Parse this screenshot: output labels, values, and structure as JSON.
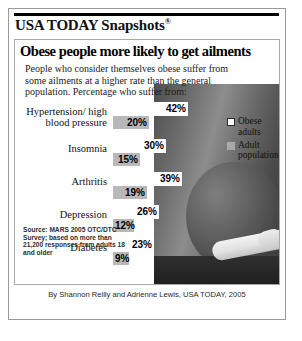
{
  "masthead": {
    "brand": "USA TODAY Snapshots",
    "registered_mark": "®"
  },
  "headline": "Obese people more likely to get ailments",
  "deck": "People who consider themselves obese suffer from some ailments at a higher rate than the general population. Percentage who suffer from:",
  "legend": {
    "items": [
      {
        "label": "Obese adults",
        "swatch": "white-outline",
        "color": "#ffffff"
      },
      {
        "label": "Adult population",
        "swatch": "gray-filled",
        "color": "#a9a9a9"
      }
    ]
  },
  "source": "Source: MARS 2005 OTC/DTC Survey; based on more than 21,200 responses from adults 18 and older",
  "credit": "By Shannon Reilly and Adrienne Lewis, USA TODAY, 2005",
  "chart_data": {
    "type": "bar",
    "orientation": "horizontal",
    "title": "Obese people more likely to get ailments",
    "subtitle": "People who consider themselves obese suffer from some ailments at a higher rate than the general population. Percentage who suffer from:",
    "categories": [
      "Hypertension/ high blood pressure",
      "Insomnia",
      "Arthritis",
      "Depression",
      "Diabetes"
    ],
    "series": [
      {
        "name": "Obese adults",
        "color": "#ffffff",
        "values": [
          42,
          30,
          39,
          26,
          23
        ]
      },
      {
        "name": "Adult population",
        "color": "#b8b8b8",
        "values": [
          20,
          15,
          19,
          12,
          9
        ]
      }
    ],
    "value_labels": [
      [
        "42%",
        "20%"
      ],
      [
        "30%",
        "15%"
      ],
      [
        "39%",
        "19%"
      ],
      [
        "26%",
        "12%"
      ],
      [
        "23%",
        "9%"
      ]
    ],
    "unit": "%",
    "xlabel": "",
    "ylabel": "",
    "xlim": [
      0,
      48
    ],
    "grid": false,
    "legend_position": "top-right"
  }
}
